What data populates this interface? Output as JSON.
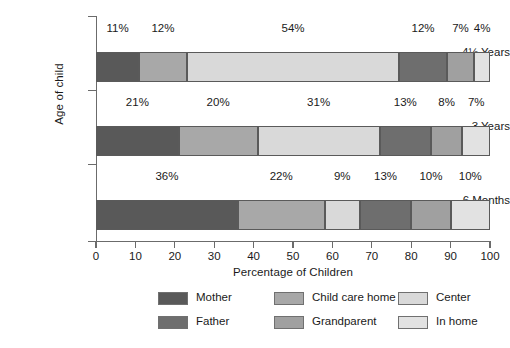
{
  "chart_data": {
    "type": "bar",
    "orientation": "horizontal",
    "stacked": true,
    "title": "",
    "xlabel": "Percentage of Children",
    "ylabel": "Age of child",
    "xlim": [
      0,
      100
    ],
    "xticks": [
      0,
      10,
      20,
      30,
      40,
      50,
      60,
      70,
      80,
      90,
      100
    ],
    "xtick_labels": [
      "0",
      "10",
      "20",
      "30",
      "40",
      "50",
      "60",
      "70",
      "80",
      "90",
      "100"
    ],
    "grid": false,
    "legend_position": "bottom",
    "legend_columns": 3,
    "categories": [
      "4½ Years",
      "3 Years",
      "6 Months"
    ],
    "segment_order": [
      "Mother",
      "Child care home",
      "Center",
      "Father",
      "Grandparent",
      "In home"
    ],
    "series": [
      {
        "name": "Mother",
        "color": "#595959",
        "values": [
          11,
          21,
          36
        ],
        "labels": [
          "11%",
          "21%",
          "36%"
        ]
      },
      {
        "name": "Child care home",
        "color": "#a8a8a8",
        "values": [
          12,
          20,
          22
        ],
        "labels": [
          "12%",
          "20%",
          "22%"
        ]
      },
      {
        "name": "Center",
        "color": "#d9d9d9",
        "values": [
          54,
          31,
          9
        ],
        "labels": [
          "54%",
          "31%",
          "9%"
        ]
      },
      {
        "name": "Father",
        "color": "#6e6e6e",
        "values": [
          12,
          13,
          13
        ],
        "labels": [
          "12%",
          "13%",
          "13%"
        ]
      },
      {
        "name": "Grandparent",
        "color": "#a0a0a0",
        "values": [
          7,
          8,
          10
        ],
        "labels": [
          "7%",
          "8%",
          "10%"
        ]
      },
      {
        "name": "In home",
        "color": "#e2e2e2",
        "values": [
          4,
          7,
          10
        ],
        "labels": [
          "4%",
          "7%",
          "10%"
        ]
      }
    ],
    "bars": [
      {
        "category": "4½ Years",
        "segments": [
          {
            "name": "Mother",
            "value": 11,
            "label": "11%",
            "color": "#595959"
          },
          {
            "name": "Child care home",
            "value": 12,
            "label": "12%",
            "color": "#a8a8a8"
          },
          {
            "name": "Center",
            "value": 54,
            "label": "54%",
            "color": "#d9d9d9"
          },
          {
            "name": "Father",
            "value": 12,
            "label": "12%",
            "color": "#6e6e6e"
          },
          {
            "name": "Grandparent",
            "value": 7,
            "label": "7%",
            "color": "#a0a0a0"
          },
          {
            "name": "In home",
            "value": 4,
            "label": "4%",
            "color": "#e2e2e2"
          }
        ]
      },
      {
        "category": "3 Years",
        "segments": [
          {
            "name": "Mother",
            "value": 21,
            "label": "21%",
            "color": "#595959"
          },
          {
            "name": "Child care home",
            "value": 20,
            "label": "20%",
            "color": "#a8a8a8"
          },
          {
            "name": "Center",
            "value": 31,
            "label": "31%",
            "color": "#d9d9d9"
          },
          {
            "name": "Father",
            "value": 13,
            "label": "13%",
            "color": "#6e6e6e"
          },
          {
            "name": "Grandparent",
            "value": 8,
            "label": "8%",
            "color": "#a0a0a0"
          },
          {
            "name": "In home",
            "value": 7,
            "label": "7%",
            "color": "#e2e2e2"
          }
        ]
      },
      {
        "category": "6 Months",
        "segments": [
          {
            "name": "Mother",
            "value": 36,
            "label": "36%",
            "color": "#595959"
          },
          {
            "name": "Child care home",
            "value": 22,
            "label": "22%",
            "color": "#a8a8a8"
          },
          {
            "name": "Center",
            "value": 9,
            "label": "9%",
            "color": "#d9d9d9"
          },
          {
            "name": "Father",
            "value": 13,
            "label": "13%",
            "color": "#6e6e6e"
          },
          {
            "name": "Grandparent",
            "value": 10,
            "label": "10%",
            "color": "#a0a0a0"
          },
          {
            "name": "In home",
            "value": 10,
            "label": "10%",
            "color": "#e2e2e2"
          }
        ]
      }
    ],
    "legend": [
      {
        "label": "Mother",
        "color": "#595959"
      },
      {
        "label": "Father",
        "color": "#6e6e6e"
      },
      {
        "label": "Child care home",
        "color": "#a8a8a8"
      },
      {
        "label": "Grandparent",
        "color": "#a0a0a0"
      },
      {
        "label": "Center",
        "color": "#d9d9d9"
      },
      {
        "label": "In home",
        "color": "#e2e2e2"
      }
    ]
  },
  "axis": {
    "x_title": "Percentage of Children",
    "y_title": "Age of child"
  }
}
